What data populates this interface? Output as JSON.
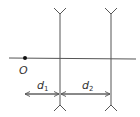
{
  "diagram": {
    "point_label": "O",
    "distance_1": {
      "symbol": "d",
      "subscript": "1"
    },
    "distance_2": {
      "symbol": "d",
      "subscript": "2"
    },
    "elements": [
      "optical-axis",
      "point-O",
      "diverging-lens-1",
      "diverging-lens-2",
      "dimension-d1",
      "dimension-d2"
    ],
    "colors": {
      "line": "#555555",
      "point": "#111111",
      "text": "#333333"
    }
  }
}
